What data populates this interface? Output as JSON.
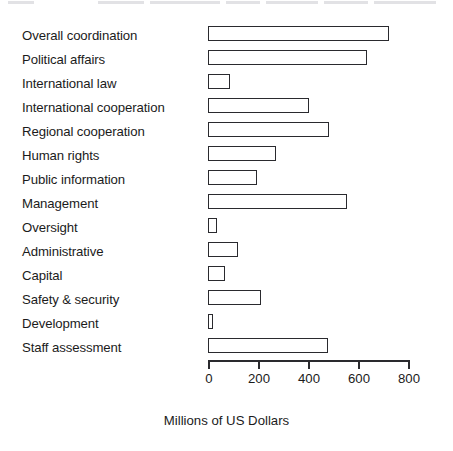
{
  "chart_data": {
    "type": "bar",
    "orientation": "horizontal",
    "title": "",
    "xlabel": "Millions of US Dollars",
    "ylabel": "",
    "categories": [
      "Overall coordination",
      "Political affairs",
      "International law",
      "International cooperation",
      "Regional cooperation",
      "Human rights",
      "Public information",
      "Management",
      "Oversight",
      "Administrative",
      "Capital",
      "Safety & security",
      "Development",
      "Staff assessment"
    ],
    "values": [
      725,
      635,
      88,
      405,
      485,
      270,
      195,
      555,
      35,
      120,
      68,
      210,
      20,
      480
    ],
    "xlim": [
      0,
      800
    ],
    "xticks": [
      0,
      200,
      400,
      600,
      800
    ],
    "xtick_labels": [
      "0",
      "200",
      "400",
      "600",
      "800"
    ],
    "grid": false,
    "legend": false,
    "bar_fill_color": "#ffffff",
    "bar_edge_color": "#2a2a2e",
    "axis_color": "#2a2a2e",
    "text_color": "#1b1b1b"
  }
}
